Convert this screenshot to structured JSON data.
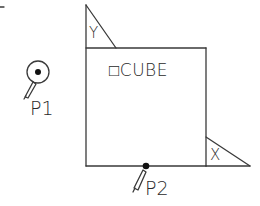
{
  "diagram": {
    "title_label": "□CUBE",
    "points": [
      {
        "id": "p1",
        "label": "P1"
      },
      {
        "id": "p2",
        "label": "P2"
      }
    ],
    "axis_markers": [
      {
        "id": "y",
        "label": "Y"
      },
      {
        "id": "x",
        "label": "X"
      }
    ],
    "colors": {
      "line": "#3a3a3a",
      "background": "#ffffff",
      "text": "#2a2a2a"
    },
    "icons": {
      "pick-point-marker": "circle-with-dot",
      "pencil": "pencil-icon",
      "snap-point": "filled-dot"
    }
  }
}
